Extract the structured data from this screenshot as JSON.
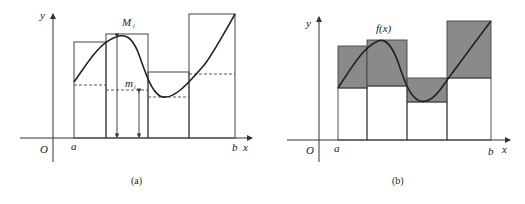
{
  "colors": {
    "line": "#333333",
    "shade": "#8a8a8a",
    "background": "#ffffff"
  },
  "panel_a": {
    "caption": "(a)",
    "axis_y_label": "y",
    "axis_x_label": "x",
    "origin_label": "O",
    "a_label": "a",
    "b_label": "b",
    "upper_label": "M",
    "upper_sub": "i",
    "lower_label": "m",
    "lower_sub": "i"
  },
  "panel_b": {
    "caption": "(b)",
    "axis_y_label": "y",
    "axis_x_label": "x",
    "origin_label": "O",
    "a_label": "a",
    "b_label": "b",
    "function_label": "f(x)"
  }
}
